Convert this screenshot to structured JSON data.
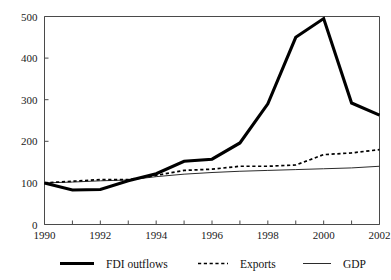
{
  "chart_data": {
    "type": "line",
    "title": "",
    "xlabel": "",
    "ylabel": "",
    "x": [
      1990,
      1991,
      1992,
      1993,
      1994,
      1995,
      1996,
      1997,
      1998,
      1999,
      2000,
      2001,
      2002
    ],
    "xlim": [
      1990,
      2002
    ],
    "ylim": [
      0,
      500
    ],
    "yticks": [
      0,
      100,
      200,
      300,
      400,
      500
    ],
    "xticks": [
      1990,
      1991,
      1992,
      1993,
      1994,
      1995,
      1996,
      1997,
      1998,
      1999,
      2000,
      2001,
      2002
    ],
    "xtick_labels_shown": [
      1990,
      1992,
      1994,
      1996,
      1998,
      2000,
      2002
    ],
    "grid": false,
    "legend_position": "bottom",
    "series": [
      {
        "name": "FDI outflows",
        "style": "thick-solid",
        "color": "#000000",
        "values": [
          100,
          83,
          84,
          105,
          122,
          152,
          157,
          196,
          290,
          450,
          495,
          292,
          263
        ]
      },
      {
        "name": "Exports",
        "style": "dotted",
        "color": "#000000",
        "values": [
          100,
          104,
          108,
          108,
          118,
          130,
          133,
          140,
          140,
          143,
          168,
          172,
          180
        ]
      },
      {
        "name": "GDP",
        "style": "thin-solid",
        "color": "#2b2b2b",
        "values": [
          100,
          102,
          105,
          107,
          115,
          121,
          125,
          128,
          130,
          132,
          134,
          136,
          140
        ]
      }
    ]
  },
  "axes": {
    "y_tick_labels": [
      "500",
      "400",
      "300",
      "200",
      "100",
      "0"
    ],
    "x_tick_labels": [
      "1990",
      "1992",
      "1994",
      "1996",
      "1998",
      "2000",
      "2002"
    ]
  },
  "legend": {
    "items": [
      {
        "label": "FDI outflows",
        "style": "thick-solid"
      },
      {
        "label": "Exports",
        "style": "dotted"
      },
      {
        "label": "GDP",
        "style": "thin-solid"
      }
    ]
  }
}
